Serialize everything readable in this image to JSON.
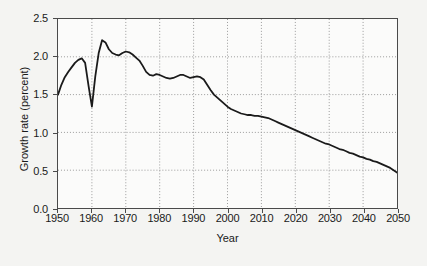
{
  "chart_data": {
    "type": "line",
    "title": "",
    "xlabel": "Year",
    "ylabel": "Growth rate (percent)",
    "xlim": [
      1950,
      2050
    ],
    "ylim": [
      0.0,
      2.5
    ],
    "xticks": [
      1950,
      1960,
      1970,
      1980,
      1990,
      2000,
      2010,
      2020,
      2030,
      2040,
      2050
    ],
    "yticks": [
      0.0,
      0.5,
      1.0,
      1.5,
      2.0,
      2.5
    ],
    "ytick_labels": [
      "0.0",
      "0.5",
      "1.0",
      "1.5",
      "2.0",
      "2.5"
    ],
    "xtick_labels": [
      "1950",
      "1960",
      "1970",
      "1980",
      "1990",
      "2000",
      "2010",
      "2020",
      "2030",
      "2040",
      "2050"
    ],
    "grid": true,
    "grid_style": "dotted",
    "legend": null,
    "line_color": "#1a1a1a",
    "line_width": 1.8,
    "background_color": "#fbfbfa",
    "figure_background": "#f4f4f2",
    "series": [
      {
        "name": "World population growth rate",
        "x": [
          1950,
          1951,
          1952,
          1953,
          1954,
          1955,
          1956,
          1957,
          1958,
          1959,
          1960,
          1961,
          1962,
          1963,
          1964,
          1965,
          1966,
          1967,
          1968,
          1969,
          1970,
          1971,
          1972,
          1973,
          1974,
          1975,
          1976,
          1977,
          1978,
          1979,
          1980,
          1981,
          1982,
          1983,
          1984,
          1985,
          1986,
          1987,
          1988,
          1989,
          1990,
          1991,
          1992,
          1993,
          1994,
          1995,
          1996,
          1997,
          1998,
          1999,
          2000,
          2001,
          2002,
          2003,
          2004,
          2005,
          2006,
          2007,
          2008,
          2009,
          2010,
          2011,
          2012,
          2013,
          2014,
          2015,
          2016,
          2017,
          2018,
          2019,
          2020,
          2021,
          2022,
          2023,
          2024,
          2025,
          2026,
          2027,
          2028,
          2029,
          2030,
          2031,
          2032,
          2033,
          2034,
          2035,
          2036,
          2037,
          2038,
          2039,
          2040,
          2041,
          2042,
          2043,
          2044,
          2045,
          2046,
          2047,
          2048,
          2049,
          2050
        ],
        "y": [
          1.5,
          1.63,
          1.73,
          1.8,
          1.86,
          1.92,
          1.96,
          1.98,
          1.92,
          1.62,
          1.34,
          1.74,
          2.05,
          2.22,
          2.19,
          2.1,
          2.05,
          2.03,
          2.02,
          2.05,
          2.07,
          2.06,
          2.03,
          1.99,
          1.95,
          1.88,
          1.8,
          1.76,
          1.75,
          1.77,
          1.76,
          1.74,
          1.72,
          1.71,
          1.72,
          1.74,
          1.76,
          1.76,
          1.74,
          1.72,
          1.73,
          1.74,
          1.73,
          1.7,
          1.63,
          1.56,
          1.5,
          1.46,
          1.42,
          1.38,
          1.34,
          1.31,
          1.29,
          1.27,
          1.25,
          1.24,
          1.23,
          1.23,
          1.22,
          1.22,
          1.21,
          1.2,
          1.19,
          1.17,
          1.15,
          1.13,
          1.11,
          1.09,
          1.07,
          1.05,
          1.03,
          1.01,
          0.99,
          0.97,
          0.95,
          0.93,
          0.91,
          0.89,
          0.87,
          0.85,
          0.84,
          0.82,
          0.8,
          0.78,
          0.77,
          0.75,
          0.73,
          0.72,
          0.7,
          0.68,
          0.67,
          0.65,
          0.64,
          0.62,
          0.61,
          0.59,
          0.57,
          0.55,
          0.53,
          0.5,
          0.47
        ]
      }
    ]
  }
}
